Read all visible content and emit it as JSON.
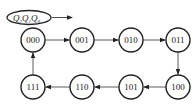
{
  "diagram": {
    "title_label": "Q2Q1Q0",
    "label_parts": [
      {
        "base": "Q",
        "sub": "2"
      },
      {
        "base": "Q",
        "sub": "1"
      },
      {
        "base": "Q",
        "sub": "0"
      }
    ],
    "states": [
      {
        "id": "s000",
        "label": "000",
        "cx": 33,
        "cy": 40
      },
      {
        "id": "s001",
        "label": "001",
        "cx": 82,
        "cy": 40
      },
      {
        "id": "s010",
        "label": "010",
        "cx": 131,
        "cy": 40
      },
      {
        "id": "s011",
        "label": "011",
        "cx": 178,
        "cy": 40
      },
      {
        "id": "s100",
        "label": "100",
        "cx": 178,
        "cy": 87
      },
      {
        "id": "s101",
        "label": "101",
        "cx": 131,
        "cy": 87
      },
      {
        "id": "s110",
        "label": "110",
        "cx": 82,
        "cy": 87
      },
      {
        "id": "s111",
        "label": "111",
        "cx": 33,
        "cy": 87
      }
    ],
    "transitions": [
      {
        "from": "000",
        "to": "001"
      },
      {
        "from": "001",
        "to": "010"
      },
      {
        "from": "010",
        "to": "011"
      },
      {
        "from": "011",
        "to": "100"
      },
      {
        "from": "100",
        "to": "101"
      },
      {
        "from": "101",
        "to": "110"
      },
      {
        "from": "110",
        "to": "111"
      },
      {
        "from": "111",
        "to": "000"
      }
    ],
    "colors": {
      "stroke": "#222222",
      "background": "#ffffff"
    }
  }
}
